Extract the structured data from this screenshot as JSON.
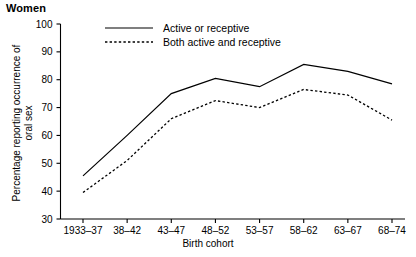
{
  "panel": {
    "title": "Women"
  },
  "axes": {
    "ylabel_line1": "Percentage reporting occurrence of",
    "ylabel_line2": "oral sex",
    "xlabel": "Birth cohort"
  },
  "chart_data": {
    "type": "line",
    "title": "Women",
    "xlabel": "Birth cohort",
    "ylabel": "Percentage reporting occurrence of oral sex",
    "categories": [
      "1933–37",
      "38–42",
      "43–47",
      "48–52",
      "53–57",
      "58–62",
      "63–67",
      "68–74"
    ],
    "yticks": [
      30,
      40,
      50,
      60,
      70,
      80,
      90,
      100
    ],
    "ylim": [
      30,
      100
    ],
    "grid": false,
    "legend_position": "top-center",
    "series": [
      {
        "name": "Active or receptive",
        "style": "solid",
        "color": "#000000",
        "values": [
          45.5,
          60.0,
          75.0,
          80.5,
          77.5,
          85.5,
          83.0,
          78.5
        ]
      },
      {
        "name": "Both active and receptive",
        "style": "dashed",
        "color": "#000000",
        "values": [
          39.5,
          51.0,
          66.0,
          72.5,
          70.0,
          76.5,
          74.5,
          65.5
        ]
      }
    ]
  }
}
